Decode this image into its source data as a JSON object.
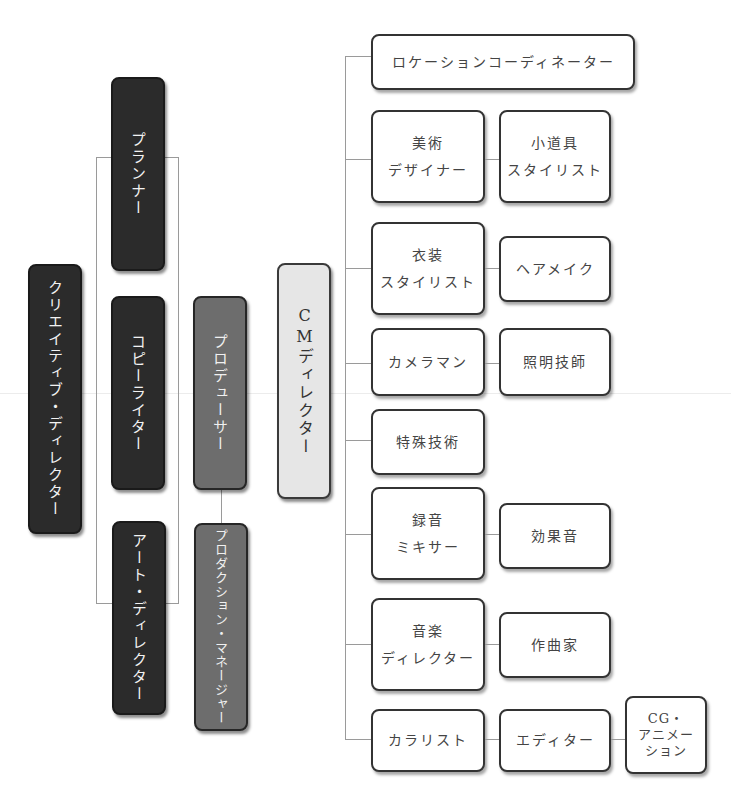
{
  "diagram": {
    "type": "organization-chart",
    "left_column": {
      "creative_director": "クリエイティブ・ディレクター"
    },
    "creative_team": [
      {
        "id": "planner",
        "label": "プランナー"
      },
      {
        "id": "copywriter",
        "label": "コピーライター"
      },
      {
        "id": "art_director",
        "label": "アート・ディレクター"
      }
    ],
    "production_team": [
      {
        "id": "producer",
        "label": "プロデューサー"
      },
      {
        "id": "production_manager",
        "label": "プロダクション・マネージャー"
      }
    ],
    "cm_director": {
      "label": "CMディレクター"
    },
    "staff_rows": [
      {
        "primary": [
          "ロケーションコーディネーター"
        ],
        "secondary": []
      },
      {
        "primary": [
          "美術",
          "デザイナー"
        ],
        "secondary": [
          [
            "小道具",
            "スタイリスト"
          ]
        ]
      },
      {
        "primary": [
          "衣装",
          "スタイリスト"
        ],
        "secondary": [
          [
            "ヘアメイク"
          ]
        ]
      },
      {
        "primary": [
          "カメラマン"
        ],
        "secondary": [
          [
            "照明技師"
          ]
        ]
      },
      {
        "primary": [
          "特殊技術"
        ],
        "secondary": []
      },
      {
        "primary": [
          "録音",
          "ミキサー"
        ],
        "secondary": [
          [
            "効果音"
          ]
        ]
      },
      {
        "primary": [
          "音楽",
          "ディレクター"
        ],
        "secondary": [
          [
            "作曲家"
          ]
        ]
      },
      {
        "primary": [
          "カラリスト"
        ],
        "secondary": [
          [
            "エディター"
          ],
          [
            "CG・",
            "アニメー",
            "ション"
          ]
        ]
      }
    ],
    "colors": {
      "creative": "#2b2b2b",
      "production": "#6d6d6d",
      "director": "#e6e6e6",
      "staff": "#ffffff",
      "connector": "#9a9a9a"
    }
  }
}
